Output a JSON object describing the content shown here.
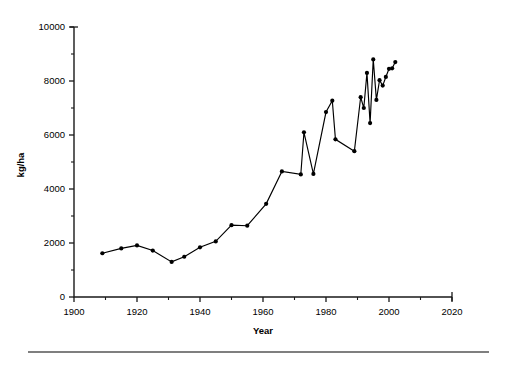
{
  "chart_data": {
    "type": "line",
    "title": "",
    "xlabel": "Year",
    "ylabel": "kg/ha",
    "xlim": [
      1900,
      2020
    ],
    "ylim": [
      0,
      10000
    ],
    "grid": false,
    "legend": null,
    "x_ticks_major": [
      1900,
      1920,
      1940,
      1960,
      1980,
      2000,
      2020
    ],
    "x_ticks_minor": [
      1910,
      1930,
      1950,
      1970,
      1990,
      2010
    ],
    "y_ticks_major": [
      0,
      2000,
      4000,
      6000,
      8000,
      10000
    ],
    "y_ticks_minor": [
      1000,
      3000,
      5000,
      7000,
      9000
    ],
    "x_tick_labels": [
      "1900",
      "1920",
      "1940",
      "1960",
      "1980",
      "2000",
      "2020"
    ],
    "y_tick_labels": [
      "0",
      "2000",
      "4000",
      "6000",
      "8000",
      "10000"
    ],
    "marker": "filled-circle",
    "series": [
      {
        "name": "Yield",
        "x": [
          1909,
          1915,
          1920,
          1925,
          1931,
          1935,
          1940,
          1945,
          1950,
          1955,
          1961,
          1966,
          1972,
          1973,
          1976,
          1980,
          1982,
          1983,
          1989,
          1991,
          1992,
          1993,
          1994,
          1995,
          1996,
          1997,
          1998,
          1999,
          2000,
          2001,
          2002
        ],
        "values": [
          1620,
          1800,
          1910,
          1720,
          1300,
          1490,
          1840,
          2060,
          2660,
          2640,
          3450,
          4650,
          4540,
          6100,
          4560,
          6850,
          7270,
          5840,
          5400,
          7400,
          7000,
          8300,
          6440,
          8800,
          7300,
          8030,
          7830,
          8150,
          8450,
          8470,
          8700
        ]
      }
    ]
  },
  "footer": {
    "rule": "horizontal-rule"
  }
}
